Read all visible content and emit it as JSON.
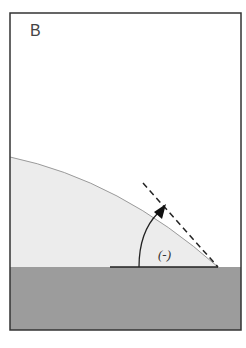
{
  "panel": {
    "label": "B"
  },
  "diagram": {
    "angle_symbol": "Θ",
    "angle_label_rendered": "(-)",
    "elements": [
      "frame",
      "liquid-drop",
      "solid-substrate",
      "baseline",
      "tangent-line-dashed",
      "angle-arc-arrow"
    ]
  },
  "colors": {
    "frame": "#333333",
    "drop_fill": "#ececec",
    "drop_edge": "#9a9a9a",
    "substrate": "#9c9c9c",
    "lines": "#222222"
  }
}
